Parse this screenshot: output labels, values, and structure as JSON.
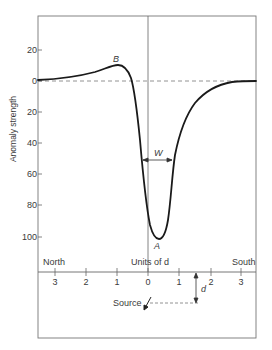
{
  "diagram": {
    "y_axis": {
      "label": "Anomaly strength",
      "ticks": [
        {
          "label": "20",
          "value": 20
        },
        {
          "label": "0",
          "value": 0
        },
        {
          "label": "20",
          "value": -20
        },
        {
          "label": "40",
          "value": -40
        },
        {
          "label": "60",
          "value": -60
        },
        {
          "label": "80",
          "value": -80
        },
        {
          "label": "100",
          "value": -100
        }
      ]
    },
    "x_axis": {
      "label": "Units of d",
      "left_label": "North",
      "right_label": "South",
      "ticks": [
        {
          "label": "3",
          "value": -3
        },
        {
          "label": "2",
          "value": -2
        },
        {
          "label": "1",
          "value": -1
        },
        {
          "label": "0",
          "value": 0
        },
        {
          "label": "1",
          "value": 1
        },
        {
          "label": "2",
          "value": 2
        },
        {
          "label": "3",
          "value": 3
        }
      ]
    },
    "points": {
      "peak_label": "B",
      "trough_label": "A"
    },
    "width_marker": "W",
    "depth_marker": "d",
    "source_label": "Source",
    "colors": {
      "line": "#1a1a1a",
      "frame": "#666666",
      "dashed": "#777777",
      "text": "#3a3a3a"
    }
  }
}
